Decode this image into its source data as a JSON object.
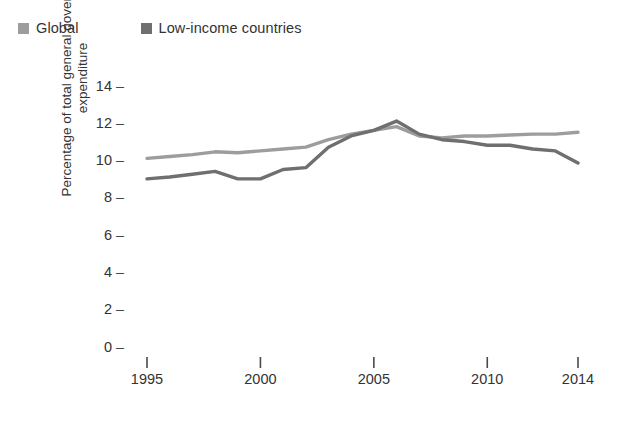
{
  "legend": {
    "items": [
      {
        "label": "Global",
        "color": "#9d9d9d",
        "key": "global"
      },
      {
        "label": "Low-income countries",
        "color": "#6f6f6f",
        "key": "low_income"
      }
    ]
  },
  "axes": {
    "ylabel_line1": "Percentage of total general government",
    "ylabel_line2": "expenditure",
    "y_ticks": [
      "0",
      "2",
      "4",
      "6",
      "8",
      "10",
      "12",
      "14"
    ],
    "y_tick_dash": "–",
    "x_ticks": [
      "1995",
      "2000",
      "2005",
      "2010",
      "2014"
    ]
  },
  "chart_data": {
    "type": "line",
    "title": "",
    "subtitle": "",
    "xlabel": "",
    "ylabel": "Percentage of total general government expenditure",
    "xlim": [
      1995,
      2014
    ],
    "ylim": [
      0,
      14
    ],
    "grid": false,
    "legend_position": "top-left",
    "x": [
      1995,
      1996,
      1997,
      1998,
      1999,
      2000,
      2001,
      2002,
      2003,
      2004,
      2005,
      2006,
      2007,
      2008,
      2009,
      2010,
      2011,
      2012,
      2013,
      2014
    ],
    "series": [
      {
        "name": "Global",
        "color": "#9d9d9d",
        "values": [
          10.2,
          10.3,
          10.4,
          10.55,
          10.5,
          10.6,
          10.7,
          10.8,
          11.2,
          11.5,
          11.7,
          11.9,
          11.4,
          11.3,
          11.4,
          11.4,
          11.45,
          11.5,
          11.5,
          11.6
        ]
      },
      {
        "name": "Low-income countries",
        "color": "#6f6f6f",
        "values": [
          9.1,
          9.2,
          9.35,
          9.5,
          9.1,
          9.1,
          9.6,
          9.7,
          10.8,
          11.4,
          11.7,
          12.2,
          11.5,
          11.2,
          11.1,
          10.9,
          10.9,
          10.7,
          10.6,
          9.95
        ]
      }
    ]
  }
}
